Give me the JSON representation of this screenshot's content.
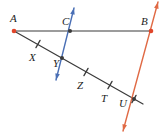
{
  "figure": {
    "type": "geometry-diagram",
    "width": 163,
    "height": 138,
    "background": "#ffffff"
  },
  "colors": {
    "black_line": "#3a3a3a",
    "blue_line": "#4a6fb5",
    "red_line": "#e06a45",
    "point_dot": "#e0452a",
    "label_text": "#1c1c1c"
  },
  "lines": [
    {
      "name": "line-AB",
      "color_key": "black_line",
      "kind": "segment",
      "from": [
        14,
        31
      ],
      "to": [
        151,
        31
      ],
      "arrows": "none"
    },
    {
      "name": "transversal-AU",
      "color_key": "black_line",
      "kind": "segment",
      "from": [
        14,
        31
      ],
      "to": [
        143,
        104
      ],
      "arrows": "none"
    },
    {
      "name": "line-through-C-and-Y",
      "color_key": "blue_line",
      "kind": "line",
      "from": [
        74,
        8
      ],
      "to": [
        56,
        80
      ],
      "arrows": "both"
    },
    {
      "name": "line-through-B-and-U",
      "color_key": "red_line",
      "kind": "line",
      "from": [
        158,
        2
      ],
      "to": [
        123,
        131
      ],
      "arrows": "both"
    }
  ],
  "points": [
    {
      "id": "A",
      "label": "A",
      "x": 14,
      "y": 31,
      "dot": true,
      "label_x": 10,
      "label_y": 13
    },
    {
      "id": "C",
      "label": "C",
      "x": 70,
      "y": 31,
      "dot": true,
      "label_x": 62,
      "label_y": 16
    },
    {
      "id": "B",
      "label": "B",
      "x": 151,
      "y": 31,
      "dot": true,
      "label_x": 141,
      "label_y": 16
    },
    {
      "id": "X",
      "label": "X",
      "x": 38,
      "y": 44,
      "dot": false,
      "label_x": 29,
      "label_y": 52
    },
    {
      "id": "Y",
      "label": "Y",
      "x": 62,
      "y": 58,
      "dot": true,
      "label_x": 53,
      "label_y": 58
    },
    {
      "id": "Z",
      "label": "Z",
      "x": 86,
      "y": 72,
      "dot": false,
      "label_x": 77,
      "label_y": 80
    },
    {
      "id": "T",
      "label": "T",
      "x": 110,
      "y": 85,
      "dot": false,
      "label_x": 101,
      "label_y": 93
    },
    {
      "id": "U",
      "label": "U",
      "x": 134,
      "y": 99,
      "dot": true,
      "label_x": 119,
      "label_y": 98
    }
  ],
  "tick_marks": [
    {
      "name": "tick-on-AX",
      "x": 38,
      "y": 44
    },
    {
      "name": "tick-on-YZ",
      "x": 86,
      "y": 72
    },
    {
      "name": "tick-on-ZT",
      "x": 110,
      "y": 85
    },
    {
      "name": "tick-on-TU",
      "x": 134,
      "y": 99
    }
  ]
}
